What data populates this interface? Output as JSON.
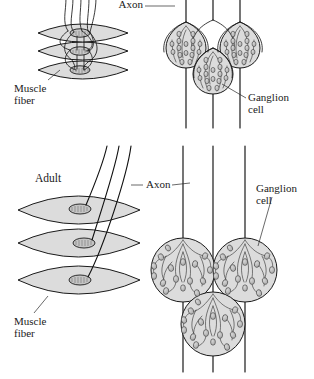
{
  "figure": {
    "background_color": "#ffffff",
    "ink_color": "#1a1a1a",
    "fill_gray": "#dcdcdc",
    "bouton_gray": "#b8b8b8",
    "panels": [
      {
        "id": "embryonic",
        "stage_label": "",
        "description": "Embryonic stage: muscle fibers and ganglion cells each receive multiple axons (polyneuronal innervation)",
        "labels": [
          {
            "name": "axon",
            "text": "Axon"
          },
          {
            "name": "muscle-fiber",
            "text": "Muscle\nfiber"
          },
          {
            "name": "ganglion-cell",
            "text": "Ganglion\ncell"
          }
        ],
        "muscle_fiber_count": 3,
        "ganglion_cell_count": 3,
        "axon_count": 3,
        "innervation": "multiple"
      },
      {
        "id": "adult",
        "stage_label": "Adult",
        "description": "Adult stage: each muscle fiber and ganglion cell receives a single axon",
        "labels": [
          {
            "name": "stage",
            "text": "Adult"
          },
          {
            "name": "axon",
            "text": "Axon"
          },
          {
            "name": "muscle-fiber",
            "text": "Muscle\nfiber"
          },
          {
            "name": "ganglion-cell",
            "text": "Ganglion\ncell"
          }
        ],
        "muscle_fiber_count": 3,
        "ganglion_cell_count": 3,
        "axon_count": 3,
        "innervation": "single"
      }
    ]
  },
  "labels": {
    "embryo_axon": "Axon",
    "embryo_muscle_line1": "Muscle",
    "embryo_muscle_line2": "fiber",
    "embryo_ganglion_line1": "Ganglion",
    "embryo_ganglion_line2": "cell",
    "adult_stage": "Adult",
    "adult_axon": "Axon",
    "adult_muscle_line1": "Muscle",
    "adult_muscle_line2": "fiber",
    "adult_ganglion_line1": "Ganglion",
    "adult_ganglion_line2": "cell"
  }
}
